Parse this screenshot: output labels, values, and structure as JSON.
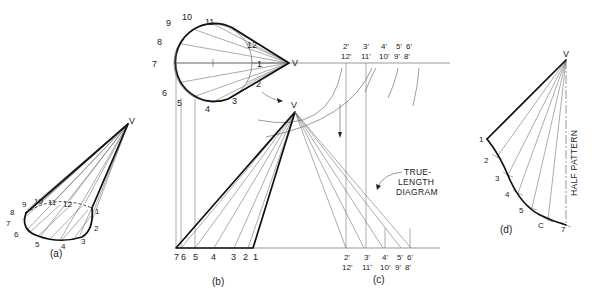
{
  "figure": {
    "vertex_label": "V",
    "views": {
      "a": {
        "caption": "(a)",
        "vertex_label": "V",
        "base_labels": [
          "1",
          "2",
          "3",
          "4",
          "5",
          "6",
          "7",
          "8",
          "9",
          "10",
          "11",
          "12"
        ]
      },
      "b": {
        "caption": "(b)",
        "top_vertex_label": "V",
        "front_vertex_label": "V",
        "top_view_labels": [
          "1",
          "2",
          "3",
          "4",
          "5",
          "6",
          "7",
          "8",
          "9",
          "10",
          "11",
          "12"
        ],
        "front_view_labels": [
          "7",
          "6",
          "5",
          "4",
          "3",
          "2",
          "1"
        ],
        "center_mark": "1"
      },
      "c": {
        "caption": "(c)",
        "top_labels_upper": [
          "2'",
          "3'",
          "4'",
          "5'",
          "6'"
        ],
        "top_labels_lower": [
          "12'",
          "11'",
          "10'",
          "9'",
          "8'"
        ],
        "bottom_labels_upper": [
          "2'",
          "3'",
          "4'",
          "5'",
          "6'"
        ],
        "bottom_labels_lower": [
          "12'",
          "11'",
          "10'",
          "9'",
          "8'"
        ],
        "note_lines": [
          "TRUE-",
          "LENGTH",
          "DIAGRAM"
        ]
      },
      "d": {
        "caption": "(d)",
        "vertex_label": "V",
        "edge_labels": [
          "1",
          "2",
          "3",
          "4",
          "5",
          "C",
          "7"
        ],
        "side_label": "HALF PATTERN"
      }
    }
  }
}
